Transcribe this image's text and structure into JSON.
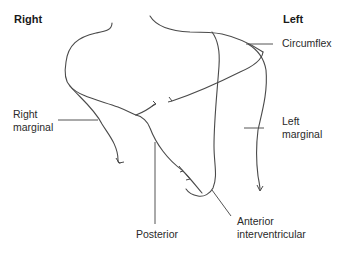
{
  "diagram": {
    "side_labels": {
      "right": "Right",
      "left": "Left"
    },
    "vessel_labels": {
      "circumflex": "Circumflex",
      "right_marginal_line1": "Right",
      "right_marginal_line2": "marginal",
      "left_marginal_line1": "Left",
      "left_marginal_line2": "marginal",
      "posterior": "Posterior",
      "anterior_iv_line1": "Anterior",
      "anterior_iv_line2": "interventricular"
    },
    "colors": {
      "line": "#4a4a4a",
      "text": "#2a2a2a",
      "background": "#ffffff"
    }
  }
}
